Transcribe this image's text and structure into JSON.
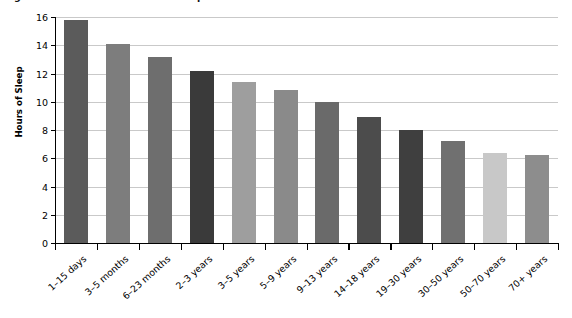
{
  "figure": {
    "caption": "Figure 3.1  Number of Hours of Sleep We Need as We Grow"
  },
  "chart_data": {
    "type": "bar",
    "title": "Figure 3.1  Number of Hours of Sleep We Need as We Grow",
    "xlabel": "",
    "ylabel": "Hours of Sleep",
    "ylim": [
      0,
      16
    ],
    "ytick_labels": [
      "0",
      "2",
      "4",
      "6",
      "8",
      "10",
      "12",
      "14",
      "16"
    ],
    "ytick_values": [
      0,
      2,
      4,
      6,
      8,
      10,
      12,
      14,
      16
    ],
    "grid": true,
    "legend": "none",
    "categories": [
      "1–15 days",
      "3–5 months",
      "6–23 months",
      "2–3 years",
      "3–5 years",
      "5–9 years",
      "9–13 years",
      "14–18 years",
      "19–30 years",
      "30–50 years",
      "50–70 years",
      "70+ years"
    ],
    "values": [
      15.8,
      14.1,
      13.2,
      12.2,
      11.4,
      10.8,
      10.0,
      8.9,
      8.0,
      7.2,
      6.4,
      6.2
    ],
    "bar_colors": [
      "#5b5b5b",
      "#7d7d7d",
      "#6e6e6e",
      "#3a3a3a",
      "#9e9e9e",
      "#8a8a8a",
      "#6a6a6a",
      "#4c4c4c",
      "#3f3f3f",
      "#707070",
      "#c8c8c8",
      "#8d8d8d"
    ]
  },
  "colors": {
    "axis": "#000000",
    "grid": "#c9c9c9",
    "background": "#ffffff"
  }
}
